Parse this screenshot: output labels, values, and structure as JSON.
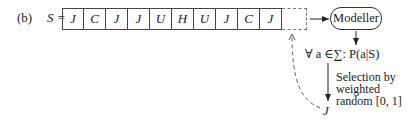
{
  "figure_label": "(b)",
  "sequence_label": "S =",
  "sequence": [
    "J",
    "C",
    "J",
    "J",
    "U",
    "H",
    "U",
    "J",
    "C",
    "J"
  ],
  "empty_slot": "",
  "modeller_label": "Modeller",
  "probability_label": "∀ a ∈∑: P(a|S)",
  "selection_label_lines": [
    "Selection by",
    "weighted",
    "random [0, 1]"
  ],
  "selected_symbol": "J"
}
